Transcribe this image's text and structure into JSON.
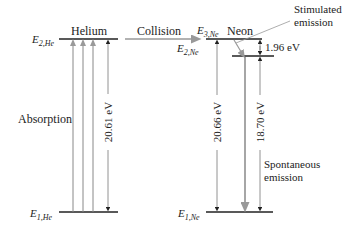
{
  "diagram": {
    "type": "energy-level diagram",
    "helium": {
      "title": "Helium",
      "upper_level": {
        "symbol": "E",
        "sub": "2,He"
      },
      "lower_level": {
        "symbol": "E",
        "sub": "1,He"
      },
      "process_label": "Absorption",
      "energy_gap": "20.61 eV"
    },
    "transfer": {
      "label": "Collision"
    },
    "neon": {
      "title": "Neon",
      "level3": {
        "symbol": "E",
        "sub": "3,Ne"
      },
      "level2": {
        "symbol": "E",
        "sub": "2,Ne"
      },
      "level1": {
        "symbol": "E",
        "sub": "1,Ne"
      },
      "gap_3_to_1": "20.66 eV",
      "gap_3_to_2": "1.96 eV",
      "gap_2_to_1": "18.70 eV",
      "stimulated_label_line1": "Stimulated",
      "stimulated_label_line2": "emission",
      "spontaneous_label_line1": "Spontaneous",
      "spontaneous_label_line2": "emission"
    },
    "colors": {
      "level_line": "#222222",
      "arrow_gray": "#888888",
      "dimension_line": "#777777"
    }
  }
}
